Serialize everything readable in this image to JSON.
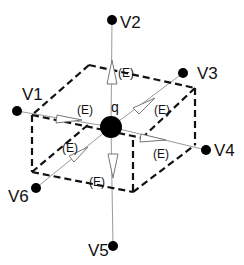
{
  "diagram": {
    "title": "",
    "charge": {
      "label": "q",
      "x": 111,
      "y": 127,
      "r": 11
    },
    "nodes": [
      {
        "id": "V1",
        "label": "V1",
        "x": 17,
        "y": 111,
        "lx": 22,
        "ly": 100
      },
      {
        "id": "V2",
        "label": "V2",
        "x": 112,
        "y": 20,
        "lx": 120,
        "ly": 28
      },
      {
        "id": "V3",
        "label": "V3",
        "x": 183,
        "y": 73,
        "lx": 197,
        "ly": 79
      },
      {
        "id": "V4",
        "label": "V4",
        "x": 206,
        "y": 150,
        "lx": 214,
        "ly": 156
      },
      {
        "id": "V5",
        "label": "V5",
        "x": 113,
        "y": 246,
        "lx": 88,
        "ly": 256
      },
      {
        "id": "V6",
        "label": "V6",
        "x": 36,
        "y": 188,
        "lx": 8,
        "ly": 202
      }
    ],
    "field_labels": [
      {
        "text": "(E)",
        "x": 118,
        "y": 77
      },
      {
        "text": "(E)",
        "x": 77,
        "y": 114
      },
      {
        "text": "(E)",
        "x": 154,
        "y": 114
      },
      {
        "text": "(E)",
        "x": 62,
        "y": 152
      },
      {
        "text": "(E)",
        "x": 153,
        "y": 158
      },
      {
        "text": "(E)",
        "x": 89,
        "y": 186
      }
    ],
    "colors": {
      "line": "#111111",
      "field_line": "#999999",
      "background": "#ffffff"
    }
  }
}
